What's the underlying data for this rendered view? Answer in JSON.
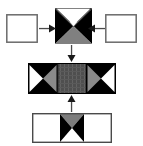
{
  "diagram": {
    "type": "texture-tile-composition-flow",
    "title": "",
    "background_color": "#ffffff",
    "palette": {
      "black": "#000000",
      "white": "#ffffff",
      "gray": "#808080",
      "dark_gray": "#4d4d4d",
      "hatch_gray": "#595959",
      "outline": "#666666",
      "arrow": "#4a4a4a"
    },
    "rows": [
      {
        "row_name": "top-row",
        "nodes": [
          {
            "name": "top-left-empty-tile",
            "label": "",
            "pattern": "empty",
            "fill": "#ffffff",
            "border": "#666666",
            "x": 6,
            "y": 14,
            "w": 32,
            "h": 29
          },
          {
            "name": "top-center-x-tile",
            "label": "",
            "pattern": "x-quad-outline-top",
            "quadrants": {
              "top": "white-outline",
              "left": "black",
              "right": "black",
              "bottom": "gray"
            },
            "x": 55,
            "y": 8,
            "w": 37,
            "h": 36
          },
          {
            "name": "top-right-empty-tile",
            "label": "",
            "pattern": "empty",
            "fill": "#ffffff",
            "border": "#666666",
            "x": 105,
            "y": 14,
            "w": 32,
            "h": 29
          }
        ]
      },
      {
        "row_name": "middle-row",
        "nodes": [
          {
            "name": "middle-composite-bar",
            "label": "",
            "pattern": "three-cell-bar",
            "cells": [
              {
                "name": "cell-left-bowtie",
                "quadrants": {
                  "top": "black",
                  "bottom": "black",
                  "left": "white",
                  "right": "gray"
                }
              },
              {
                "name": "cell-center-hatch",
                "quadrants": {
                  "fill": "hatch-dark-gray"
                }
              },
              {
                "name": "cell-right-bowtie",
                "quadrants": {
                  "top": "black",
                  "bottom": "black",
                  "left": "gray",
                  "right": "white"
                }
              }
            ],
            "x": 28,
            "y": 63,
            "w": 88,
            "h": 31
          }
        ]
      },
      {
        "row_name": "bottom-row",
        "nodes": [
          {
            "name": "bottom-composite-bar",
            "label": "",
            "pattern": "three-cell-bar",
            "cells": [
              {
                "name": "cell-left-empty",
                "quadrants": {
                  "fill": "white"
                }
              },
              {
                "name": "cell-center-hourglass",
                "quadrants": {
                  "top": "gray",
                  "bottom": "white",
                  "left": "black",
                  "right": "black"
                }
              },
              {
                "name": "cell-right-empty",
                "quadrants": {
                  "fill": "white"
                }
              }
            ],
            "x": 32,
            "y": 113,
            "w": 80,
            "h": 30
          }
        ]
      }
    ],
    "arrows": [
      {
        "name": "arrow-left-to-center",
        "direction": "right",
        "label": "",
        "x": 39,
        "y": 24,
        "w": 17,
        "h": 9
      },
      {
        "name": "arrow-right-to-center",
        "direction": "left",
        "label": "",
        "x": 88,
        "y": 24,
        "w": 17,
        "h": 9
      },
      {
        "name": "arrow-top-to-middle",
        "direction": "down",
        "label": "",
        "x": 67,
        "y": 45,
        "w": 9,
        "h": 17
      },
      {
        "name": "arrow-bottom-to-middle",
        "direction": "up",
        "label": "",
        "x": 67,
        "y": 95,
        "w": 9,
        "h": 17
      }
    ],
    "annotations": [
      {
        "name": "corner-tick-mark",
        "label": "",
        "x": 89,
        "y": 8,
        "w": 4,
        "h": 4
      }
    ]
  }
}
